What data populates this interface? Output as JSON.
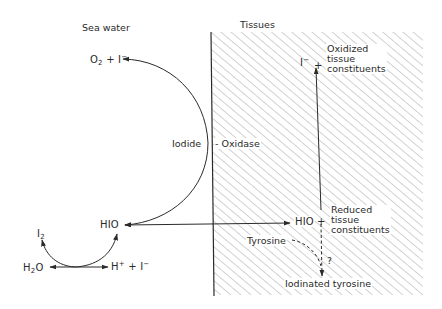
{
  "diagram": {
    "regions": {
      "sea_water": "Sea water",
      "tissues": "Tissues"
    },
    "species": {
      "o2": "O",
      "o2_sub": "2",
      "plus": "+",
      "iodide_ion": "I",
      "iodide_charge": "−",
      "hio_left": "HIO",
      "hio_right": "HIO",
      "i2": "I",
      "i2_sub": "2",
      "h2o_h": "H",
      "h2o_sub": "2",
      "h2o_o": "O",
      "h_ion": "H",
      "h_charge": "+",
      "i_ion_bottom": "I",
      "i_ion_bottom_charge": "−",
      "i_ion_top": "I",
      "i_ion_top_charge": "−",
      "plus_top": "+",
      "plus_right": "+"
    },
    "labels": {
      "iodide": "Iodide",
      "oxidase": "- Oxidase",
      "oxidized": "Oxidized\ntissue\nconstituents",
      "reduced": "Reduced\ntissue\nconstituents",
      "tyrosine": "Tyrosine",
      "question": "?",
      "iodinated_tyrosine": "Iodinated tyrosine"
    },
    "colors": {
      "ink": "#2a2a2a",
      "hatch": "#9a9a9a",
      "background": "#ffffff"
    }
  }
}
